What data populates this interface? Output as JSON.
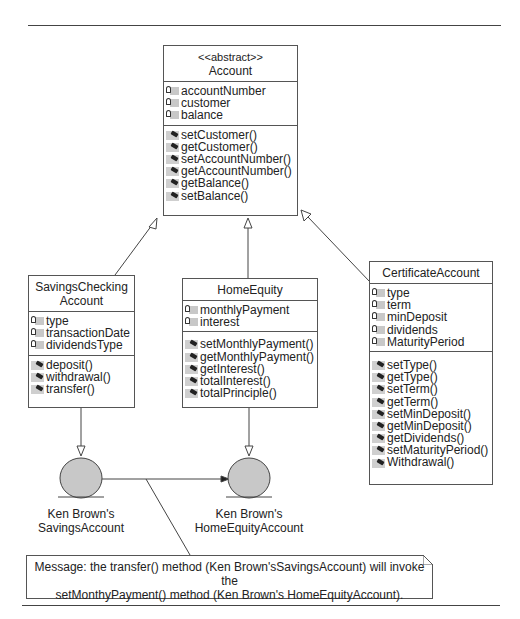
{
  "classes": {
    "account": {
      "stereotype": "<<abstract>>",
      "name": "Account",
      "attributes": [
        "accountNumber",
        "customer",
        "balance"
      ],
      "operations": [
        "setCustomer()",
        "getCustomer()",
        "setAccountNumber()",
        "getAccountNumber()",
        "getBalance()",
        "setBalance()"
      ]
    },
    "savings": {
      "name_line1": "SavingsChecking",
      "name_line2": "Account",
      "attributes": [
        "type",
        "transactionDate",
        "dividendsType"
      ],
      "operations": [
        "deposit()",
        "withdrawal()",
        "transfer()"
      ]
    },
    "home": {
      "name": "HomeEquity",
      "attributes": [
        "monthlyPayment",
        "interest"
      ],
      "operations": [
        "setMonthlyPayment()",
        "getMonthlyPayment()",
        "getInterest()",
        "totalInterest()",
        "totalPrinciple()"
      ]
    },
    "cert": {
      "name": "CertificateAccount",
      "attributes": [
        "type",
        "term",
        "minDeposit",
        "dividends",
        "MaturityPeriod"
      ],
      "operations": [
        "setType()",
        "getType()",
        "setTerm()",
        "getTerm()",
        "setMinDeposit()",
        "getMinDeposit()",
        "getDividends()",
        "setMaturityPeriod()",
        "Withdrawal()"
      ]
    }
  },
  "objects": {
    "savings_obj": {
      "line1": "Ken Brown's",
      "line2": "SavingsAccount"
    },
    "home_obj": {
      "line1": "Ken Brown's",
      "line2": "HomeEquityAccount"
    }
  },
  "note": {
    "line1": "Message: the transfer() method (Ken Brown'sSavingsAccount) will invoke the",
    "line2": "setMonthyPayment() method (Ken Brown's HomeEquityAccount)."
  },
  "icons": {
    "attribute": "lock-attribute-icon",
    "operation": "method-operation-icon"
  },
  "colors": {
    "line": "#444444",
    "object_fill": "#c8c8c8",
    "icon_fill": "#cfcfcf"
  }
}
